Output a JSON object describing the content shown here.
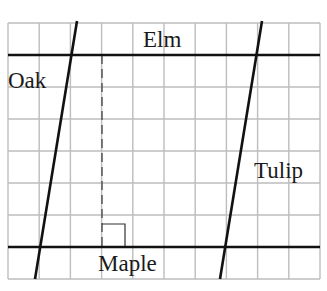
{
  "diagram": {
    "grid": {
      "left": 8,
      "top": 23,
      "right": 320,
      "bottom": 279,
      "columns": 10,
      "rows": 8,
      "line_color": "#bdbdbd"
    },
    "streets": [
      {
        "name": "Elm",
        "orientation": "horizontal",
        "x1": 8,
        "y1": 55,
        "x2": 320,
        "y2": 55
      },
      {
        "name": "Maple",
        "orientation": "horizontal",
        "x1": 8,
        "y1": 247,
        "x2": 320,
        "y2": 247
      },
      {
        "name": "Oak",
        "orientation": "slanted",
        "x1": 77,
        "y1": 21,
        "x2": 35,
        "y2": 279
      },
      {
        "name": "Tulip",
        "orientation": "slanted",
        "x1": 262,
        "y1": 21,
        "x2": 220,
        "y2": 279
      }
    ],
    "perpendicular": {
      "style": "dashed",
      "x": 102,
      "y_top": 55,
      "y_bottom": 247,
      "right_angle_marker": {
        "x": 102,
        "y": 224,
        "size": 23
      }
    },
    "labels": {
      "elm": "Elm",
      "oak": "Oak",
      "tulip": "Tulip",
      "maple": "Maple"
    },
    "colors": {
      "street_line": "#111111",
      "label_text": "#1a1a1a",
      "background": "#ffffff"
    }
  }
}
